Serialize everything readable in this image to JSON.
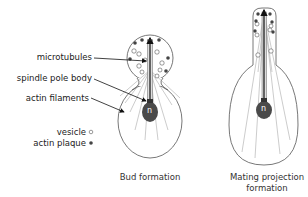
{
  "labels": {
    "microtubules": "microtubules",
    "spindle_pole_body": "spindle pole body",
    "actin_filaments": "actin filaments",
    "vesicle": "vesicle",
    "actin_plaque": "actin plaque",
    "nucleus_left": "n",
    "nucleus_right": "n"
  },
  "captions": {
    "bud": "Bud formation",
    "mating_line1": "Mating projection",
    "mating_line2": "formation"
  },
  "colors": {
    "outline": "#555555",
    "nucleus": "#4a4a4a",
    "plaque": "#444444",
    "filament": "#999999"
  }
}
